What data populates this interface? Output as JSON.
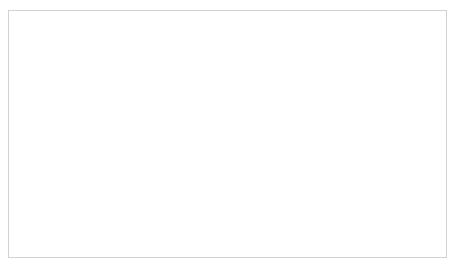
{
  "chart_data": {
    "type": "bar",
    "subtype": "stacked-100-percent",
    "title": "",
    "xlabel": "",
    "ylabel": "",
    "categories": [
      "2009",
      "2010",
      "2011",
      "2012",
      "2013",
      "2014",
      "2015",
      "2016",
      "2017",
      "2018",
      "2019"
    ],
    "series": [
      {
        "name": "With name of affected country",
        "color": "#909090",
        "stack_position": "bottom",
        "values": [
          10,
          11,
          9.5,
          9,
          9,
          9,
          9.5,
          8,
          9.5,
          3.5,
          9
        ]
      },
      {
        "name": "With no name of affected country",
        "color": "#b3b3b3",
        "stack_position": "top",
        "values": [
          90,
          89,
          90.5,
          91,
          91,
          91,
          90.5,
          92,
          90.5,
          96.5,
          91
        ]
      }
    ],
    "ylim": [
      0,
      100
    ],
    "y_ticks": [
      "0%",
      "10%",
      "20%",
      "30%",
      "40%",
      "50%",
      "60%",
      "70%",
      "80%",
      "90%",
      "100%"
    ],
    "y_tick_values": [
      0,
      10,
      20,
      30,
      40,
      50,
      60,
      70,
      80,
      90,
      100
    ],
    "grid": true,
    "grid_axis": "y",
    "legend_position": "bottom",
    "legend": [
      {
        "label": "With name of affected country",
        "swatch_color": "#909090"
      },
      {
        "label": "With no name of affected country",
        "swatch_color": "#b3b3b3"
      }
    ]
  }
}
